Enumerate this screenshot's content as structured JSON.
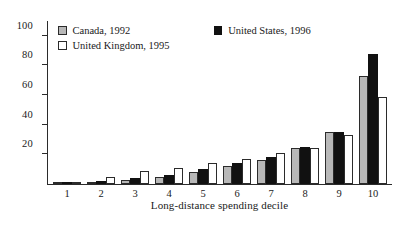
{
  "chart_data": {
    "type": "bar",
    "title": "",
    "xlabel": "Long-distance spending decile",
    "ylabel": "",
    "ylim": [
      0,
      110
    ],
    "yticks": [
      20,
      40,
      60,
      80,
      100
    ],
    "grid": false,
    "legend_position": "top-left",
    "categories": [
      "1",
      "2",
      "3",
      "4",
      "5",
      "6",
      "7",
      "8",
      "9",
      "10"
    ],
    "series": [
      {
        "name": "Canada, 1992",
        "color": "#b8b8b8",
        "values": [
          0.3,
          1,
          3,
          5,
          8,
          12,
          16,
          24,
          35,
          73
        ]
      },
      {
        "name": "United States, 1996",
        "color": "#111111",
        "values": [
          0.5,
          2,
          4,
          6,
          10,
          14,
          18,
          25,
          35,
          88
        ]
      },
      {
        "name": "United Kingdom, 1995",
        "color": "#ffffff",
        "values": [
          0.3,
          5,
          9,
          11,
          14,
          17,
          21,
          24,
          33,
          59
        ]
      }
    ]
  },
  "legend": {
    "entries": [
      {
        "label": "Canada, 1992"
      },
      {
        "label": "United Kingdom, 1995"
      },
      {
        "label": "United States, 1996"
      }
    ]
  }
}
